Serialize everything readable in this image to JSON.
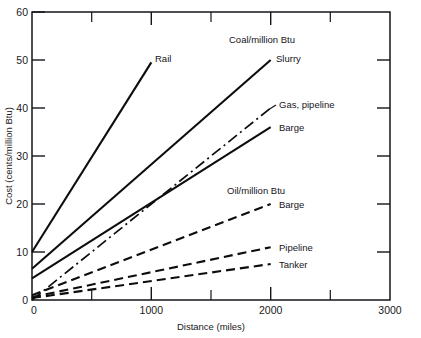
{
  "chart_data": {
    "type": "line",
    "title": "",
    "xlabel": "Distance (miles)",
    "ylabel": "Cost (cents/million Btu)",
    "xlim": [
      0,
      3000
    ],
    "ylim": [
      0,
      60
    ],
    "xticks": [
      0,
      1000,
      2000,
      3000
    ],
    "xticklabels": [
      "0",
      "1000",
      "2000",
      "3000"
    ],
    "xminorticks": [
      500,
      1500,
      2500
    ],
    "yticks": [
      0,
      10,
      20,
      30,
      40,
      50,
      60
    ],
    "yticklabels": [
      "0",
      "10",
      "20",
      "30",
      "40",
      "50",
      "60"
    ],
    "grid": false,
    "legend_position": "inline-annotations",
    "group_labels": [
      {
        "text": "Coal/million Btu",
        "x": 1650,
        "y": 53.5
      },
      {
        "text": "Oil/million Btu",
        "x": 1640,
        "y": 24.5
      }
    ],
    "series": [
      {
        "name": "Rail",
        "group": "Coal/million Btu",
        "style": "solid",
        "x": [
          0,
          1000
        ],
        "y": [
          10.0,
          49.5
        ],
        "label": "Rail",
        "label_x": 1010,
        "label_y": 50.5
      },
      {
        "name": "Slurry",
        "group": "Coal/million Btu",
        "style": "solid",
        "x": [
          0,
          2000
        ],
        "y": [
          6.5,
          50.0
        ],
        "label": "Slurry",
        "label_x": 2030,
        "label_y": 49.5
      },
      {
        "name": "Gas, pipeline",
        "group": "Gas",
        "style": "dash-dot",
        "x": [
          0,
          2000
        ],
        "y": [
          0.0,
          40.0
        ],
        "label": "Gas, pipeline",
        "label_x": 2050,
        "label_y": 40.0
      },
      {
        "name": "Barge (coal)",
        "group": "Coal/million Btu",
        "style": "solid",
        "x": [
          0,
          2000
        ],
        "y": [
          4.5,
          36.0
        ],
        "label": "Barge",
        "label_x": 2060,
        "label_y": 35.5
      },
      {
        "name": "Barge (oil)",
        "group": "Oil/million Btu",
        "style": "dashed",
        "x": [
          0,
          2000
        ],
        "y": [
          1.0,
          20.0
        ],
        "label": "Barge",
        "label_x": 2060,
        "label_y": 20.0
      },
      {
        "name": "Pipeline (oil)",
        "group": "Oil/million Btu",
        "style": "dashed",
        "x": [
          0,
          2000
        ],
        "y": [
          0.6,
          11.0
        ],
        "label": "Pipeline",
        "label_x": 2060,
        "label_y": 11.0
      },
      {
        "name": "Tanker (oil)",
        "group": "Oil/million Btu",
        "style": "dashed",
        "x": [
          0,
          2000
        ],
        "y": [
          0.4,
          7.5
        ],
        "label": "Tanker",
        "label_x": 2060,
        "label_y": 7.3
      }
    ]
  }
}
